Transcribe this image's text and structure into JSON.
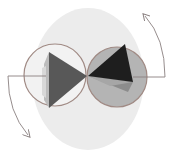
{
  "diagram": {
    "type": "rotation-diagram",
    "colors": {
      "background": "#ffffff",
      "ellipse_fill": "#ececec",
      "circle_outline": "#a08a84",
      "right_circle_fill": "#b4b4b4",
      "left_tetra_front": "#585858",
      "left_tetra_side": "#b8b8b8",
      "right_tetra_front": "#1e1e1e",
      "right_tetra_lower": "#8c8c8c",
      "arrow": "#8a8080"
    },
    "elements": [
      {
        "name": "background-ellipse"
      },
      {
        "name": "left-circle",
        "filled": false
      },
      {
        "name": "right-circle",
        "filled": true
      },
      {
        "name": "left-tetrahedron",
        "orientation": "pointing-right"
      },
      {
        "name": "right-tetrahedron",
        "orientation": "pointing-left"
      },
      {
        "name": "left-rotation-arrow",
        "direction": "down"
      },
      {
        "name": "right-rotation-arrow",
        "direction": "up"
      }
    ]
  }
}
